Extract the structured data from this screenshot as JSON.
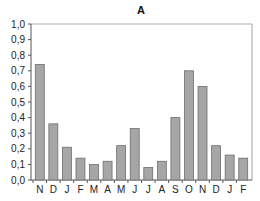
{
  "chart_data": {
    "type": "bar",
    "title": "A",
    "xlabel": "",
    "ylabel": "",
    "categories": [
      "N",
      "D",
      "J",
      "F",
      "M",
      "A",
      "M",
      "J",
      "J",
      "A",
      "S",
      "O",
      "N",
      "D",
      "J",
      "F"
    ],
    "values": [
      0.74,
      0.36,
      0.21,
      0.14,
      0.1,
      0.12,
      0.22,
      0.33,
      0.08,
      0.12,
      0.4,
      0.7,
      0.6,
      0.22,
      0.16,
      0.14
    ],
    "ylim": [
      0,
      1.0
    ],
    "yticks": [
      "0,0",
      "0,1",
      "0,2",
      "0,3",
      "0,4",
      "0,5",
      "0,6",
      "0,7",
      "0,8",
      "0,9",
      "1,0"
    ],
    "grid": false,
    "legend": null,
    "colors": {
      "bar_fill": "#a6a6a6",
      "bar_stroke": "#6e6e6e",
      "frame": "#b0b0b0",
      "axis": "#555555"
    }
  }
}
